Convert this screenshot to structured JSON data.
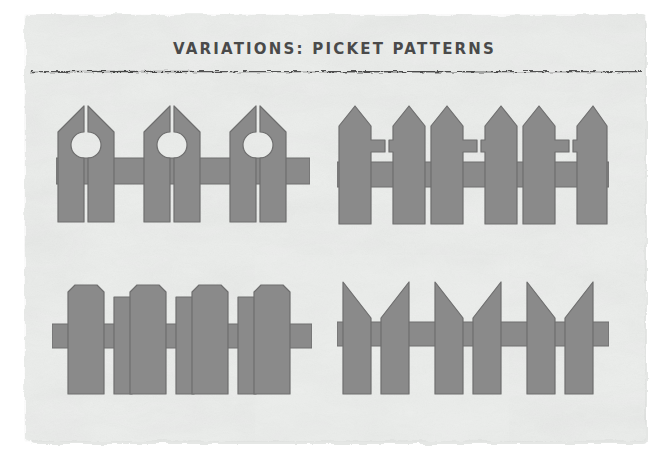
{
  "page": {
    "title": "VARIATIONS: PICKET PATTERNS",
    "background_color": "#ffffff",
    "paper_color": "#eceeec",
    "paper_shadow_color": "#e2e4e2",
    "rule_color": "#3d3d3d",
    "title_color": "#4a4a4a"
  },
  "style": {
    "picket_fill": "#8a8a8a",
    "picket_stroke": "#6e6e6e",
    "stroke_width": 1.2
  },
  "figures": [
    {
      "id": "fence-1",
      "name": "keyhole-picket-fence",
      "label": "Keyhole picket pattern",
      "position": {
        "x": 56,
        "y": 96,
        "width": 254,
        "height": 133
      },
      "picket_top": "pointed",
      "cutout": "keyhole",
      "pair_count": 3,
      "rail_count": 1
    },
    {
      "id": "fence-2",
      "name": "cross-picket-fence",
      "label": "Cross cutout picket pattern",
      "position": {
        "x": 337,
        "y": 96,
        "width": 272,
        "height": 133
      },
      "picket_top": "pointed",
      "cutout": "cross",
      "pair_count": 3,
      "rail_count": 1
    },
    {
      "id": "fence-3",
      "name": "alternating-chamfer-picket-fence",
      "label": "Alternating wide and narrow chamfered pickets",
      "position": {
        "x": 52,
        "y": 276,
        "width": 260,
        "height": 120
      },
      "picket_top": "chamfered",
      "cutout": "none",
      "wide_count": 4,
      "narrow_count": 3,
      "rail_count": 1
    },
    {
      "id": "fence-4",
      "name": "angled-chevron-picket-fence",
      "label": "Mirrored diagonal-cut picket pattern",
      "position": {
        "x": 337,
        "y": 276,
        "width": 272,
        "height": 120
      },
      "picket_top": "diagonal",
      "cutout": "none",
      "pair_count": 3,
      "rail_count": 1
    }
  ]
}
